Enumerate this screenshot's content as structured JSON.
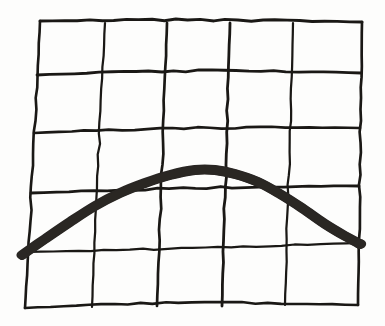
{
  "figure": {
    "title": "Hand-drawn grid with plotted curve",
    "background_color": "#fdfdfc",
    "ink_color": "#1a1815",
    "curve_color": "#2a2724",
    "width": 385,
    "height": 326
  },
  "grid": {
    "name": "hand-drawn-grid",
    "columns": 5,
    "rows": 5,
    "line_width": 2.6,
    "corners": {
      "top_left": [
        40,
        21
      ],
      "top_right": [
        362,
        22
      ],
      "bottom_left": [
        25,
        308
      ],
      "bottom_right": [
        358,
        305
      ]
    },
    "vertical_lines": [
      {
        "id": "v0",
        "top": [
          40,
          21
        ],
        "mid": [
          33,
          165
        ],
        "bottom": [
          25,
          308
        ]
      },
      {
        "id": "v1",
        "top": [
          105,
          23
        ],
        "mid": [
          98,
          166
        ],
        "bottom": [
          92,
          307
        ]
      },
      {
        "id": "v2",
        "top": [
          167,
          23
        ],
        "mid": [
          162,
          165
        ],
        "bottom": [
          157,
          306
        ]
      },
      {
        "id": "v3",
        "top": [
          230,
          23
        ],
        "mid": [
          226,
          165
        ],
        "bottom": [
          222,
          306
        ]
      },
      {
        "id": "v4",
        "top": [
          293,
          23
        ],
        "mid": [
          289,
          164
        ],
        "bottom": [
          285,
          305
        ]
      },
      {
        "id": "v5",
        "top": [
          362,
          22
        ],
        "mid": [
          360,
          164
        ],
        "bottom": [
          358,
          305
        ]
      }
    ],
    "horizontal_lines": [
      {
        "id": "h0",
        "left": [
          40,
          21
        ],
        "mid": [
          201,
          20
        ],
        "right": [
          362,
          22
        ]
      },
      {
        "id": "h1",
        "left": [
          37,
          75
        ],
        "mid": [
          199,
          71
        ],
        "right": [
          361,
          73
        ]
      },
      {
        "id": "h2",
        "left": [
          34,
          133
        ],
        "mid": [
          197,
          128
        ],
        "right": [
          360,
          128
        ]
      },
      {
        "id": "h3",
        "left": [
          31,
          193
        ],
        "mid": [
          195,
          188
        ],
        "right": [
          359,
          186
        ]
      },
      {
        "id": "h4",
        "left": [
          28,
          252
        ],
        "mid": [
          193,
          248
        ],
        "right": [
          359,
          243
        ]
      },
      {
        "id": "h5",
        "left": [
          25,
          308
        ],
        "mid": [
          191,
          303
        ],
        "right": [
          358,
          305
        ]
      }
    ]
  },
  "chart_data": {
    "type": "line",
    "title": "",
    "xlabel": "",
    "ylabel": "",
    "grid": true,
    "legend_position": "none",
    "xlim": [
      0,
      5
    ],
    "ylim": [
      0,
      5
    ],
    "xticks": [
      0,
      1,
      2,
      3,
      4,
      5
    ],
    "yticks": [
      0,
      1,
      2,
      3,
      4,
      5
    ],
    "xticklabels": [
      "",
      "",
      "",
      "",
      "",
      ""
    ],
    "yticklabels": [
      "",
      "",
      "",
      "",
      "",
      ""
    ],
    "series": [
      {
        "name": "hand-drawn-arc",
        "style": "thick hand-drawn stroke",
        "color": "#2a2724",
        "line_width": 9,
        "x": [
          0.0,
          0.5,
          1.0,
          1.5,
          2.0,
          2.5,
          3.0,
          3.5,
          4.0,
          4.5,
          5.0
        ],
        "y": [
          0.95,
          1.45,
          1.85,
          2.15,
          2.38,
          2.45,
          2.38,
          2.2,
          1.95,
          1.6,
          1.12
        ]
      }
    ],
    "annotations": []
  },
  "curve": {
    "name": "plotted-curve",
    "stroke_width_max": 10,
    "stroke_width_min": 6,
    "pixel_points": [
      [
        22,
        255
      ],
      [
        45,
        239
      ],
      [
        70,
        222
      ],
      [
        95,
        206
      ],
      [
        120,
        193
      ],
      [
        145,
        183
      ],
      [
        170,
        175
      ],
      [
        195,
        170
      ],
      [
        215,
        170
      ],
      [
        235,
        174
      ],
      [
        258,
        182
      ],
      [
        280,
        194
      ],
      [
        302,
        208
      ],
      [
        325,
        224
      ],
      [
        345,
        236
      ],
      [
        360,
        244
      ]
    ],
    "left_endpoint": [
      22,
      255
    ],
    "right_endpoint": [
      360,
      244
    ],
    "apex": [
      200,
      169
    ]
  }
}
